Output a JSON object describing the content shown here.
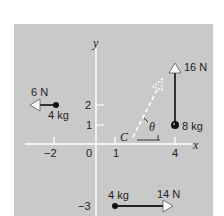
{
  "figure": {
    "axes": {
      "x_label": "x",
      "y_label": "y",
      "x_ticks": [
        "−2",
        "0",
        "1",
        "4"
      ],
      "y_ticks": [
        "2",
        "1",
        "−3"
      ]
    },
    "particles": [
      {
        "mass_label": "4 kg",
        "force_label": "6 N",
        "position": [
          -2,
          2
        ],
        "force_direction": "left"
      },
      {
        "mass_label": "8 kg",
        "force_label": "16 N",
        "position": [
          4,
          1
        ],
        "force_direction": "up"
      },
      {
        "mass_label": "4 kg",
        "force_label": "14 N",
        "position": [
          1,
          -3
        ],
        "force_direction": "right"
      }
    ],
    "center_of_mass_label": "C",
    "angle_label": "θ",
    "colors": {
      "panel": "#c9c9c9",
      "axis": "#ffffff",
      "ink": "#222222"
    }
  }
}
